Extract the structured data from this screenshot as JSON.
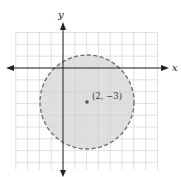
{
  "figure": {
    "type": "circle-region-graph",
    "x_axis_label": "x",
    "y_axis_label": "y",
    "center_label": "(2, −3)",
    "center": [
      2,
      -3
    ],
    "radius": 4,
    "boundary": "dashed",
    "fill": "shaded interior",
    "grid": {
      "x_range": [
        -4,
        8
      ],
      "y_range": [
        -9,
        3
      ],
      "step": 1
    },
    "colors": {
      "grid": "#d4d4d4",
      "axis": "#222222",
      "fill": "#d9d9d9",
      "boundary": "#6a6a6a",
      "center_point": "#555555"
    }
  }
}
